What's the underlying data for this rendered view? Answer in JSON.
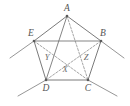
{
  "figure": {
    "stroke_color": "#6b6b6b",
    "dashed_color": "#8f8f8f",
    "label_color": "#555555",
    "background": "#ffffff"
  },
  "vertices": [
    {
      "id": "A",
      "label": "A",
      "x": 67,
      "y": 16,
      "label_x": 67,
      "label_y": 11
    },
    {
      "id": "B",
      "label": "B",
      "x": 101,
      "y": 41,
      "label_x": 101,
      "label_y": 35
    },
    {
      "id": "C",
      "label": "C",
      "x": 88,
      "y": 80,
      "label_x": 88,
      "label_y": 90
    },
    {
      "id": "D",
      "label": "D",
      "x": 46,
      "y": 80,
      "label_x": 46,
      "label_y": 90
    },
    {
      "id": "E",
      "label": "E",
      "x": 34,
      "y": 41,
      "label_x": 31,
      "label_y": 35
    }
  ],
  "interior_points": [
    {
      "id": "X",
      "label": "X",
      "x": 66,
      "y": 71,
      "label_x": 65,
      "label_y": 71
    },
    {
      "id": "Y",
      "label": "Y",
      "x": 49,
      "y": 60,
      "label_x": 47,
      "label_y": 59
    },
    {
      "id": "Z",
      "label": "Z",
      "x": 84,
      "y": 60,
      "label_x": 85,
      "label_y": 59
    }
  ],
  "sides": [
    {
      "from": "A",
      "to": "B",
      "style": "solid"
    },
    {
      "from": "B",
      "to": "C",
      "style": "solid"
    },
    {
      "from": "C",
      "to": "D",
      "style": "solid"
    },
    {
      "from": "D",
      "to": "E",
      "style": "solid"
    },
    {
      "from": "E",
      "to": "A",
      "style": "solid"
    }
  ],
  "diagonals": [
    {
      "from": "A",
      "to": "C",
      "style": "dashed"
    },
    {
      "from": "A",
      "to": "D",
      "style": "solid"
    },
    {
      "from": "B",
      "to": "D",
      "style": "dashed"
    },
    {
      "from": "C",
      "to": "E",
      "style": "dashed"
    },
    {
      "from": "B",
      "to": "E",
      "style": "solid"
    }
  ],
  "extension_rays": [
    {
      "id": "ray-beyond-E",
      "x1": 34,
      "y1": 41,
      "x2": 10,
      "y2": 58
    },
    {
      "id": "ray-beyond-B",
      "x1": 101,
      "y1": 41,
      "x2": 124,
      "y2": 58
    },
    {
      "id": "ray-beyond-D",
      "x1": 46,
      "y1": 80,
      "x2": 18,
      "y2": 96
    },
    {
      "id": "ray-beyond-C",
      "x1": 88,
      "y1": 80,
      "x2": 117,
      "y2": 96
    }
  ]
}
